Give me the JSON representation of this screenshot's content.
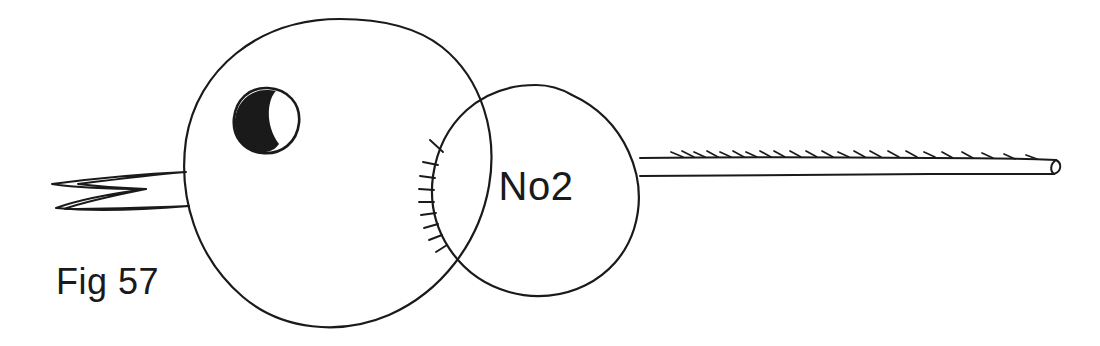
{
  "figure": {
    "background_color": "#ffffff",
    "ink_color": "#1a1a1a",
    "caption": "Fig 57",
    "body_label": "No2",
    "media": "hand-drawn ink line illustration"
  },
  "labels": {
    "figure_number": "Fig 57",
    "segment_number": "No2"
  },
  "parts": {
    "head": {
      "name": "head-circle",
      "cx": 338,
      "cy": 173,
      "r": 155
    },
    "eye": {
      "name": "eye",
      "cx": 267,
      "cy": 120,
      "r": 33,
      "pupil": "dark crescent on left side"
    },
    "beak": {
      "name": "open-beak",
      "upper_tip_x": 52,
      "upper_tip_y": 184,
      "lower_tip_x": 56,
      "lower_tip_y": 208,
      "attach_x": 186
    },
    "body": {
      "name": "body-circle",
      "cx": 536,
      "cy": 190,
      "r": 105
    },
    "hatching": {
      "name": "hatch-marks",
      "count": 9,
      "location": "left arc of body circle"
    },
    "tail": {
      "name": "tail",
      "start_x": 640,
      "end_x": 1058,
      "top_y": 157,
      "bottom_y": 176,
      "barb_count": 22
    }
  }
}
